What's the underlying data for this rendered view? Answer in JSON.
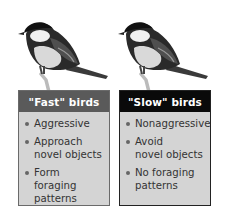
{
  "figure": {
    "panels": [
      {
        "id": "fast",
        "title": "\"Fast\" birds",
        "header_color": "#5a5a5a",
        "items": [
          "Aggressive",
          "Approach\nnovel objects",
          "Form foraging\npatterns"
        ]
      },
      {
        "id": "slow",
        "title": "\"Slow\" birds",
        "header_color": "#0a0a0a",
        "items": [
          "Nonaggressive",
          "Avoid\nnovel objects",
          "No foraging\npatterns"
        ]
      }
    ],
    "images": [
      {
        "subject": "great-tit-bird-icon"
      },
      {
        "subject": "great-tit-bird-icon"
      }
    ]
  }
}
